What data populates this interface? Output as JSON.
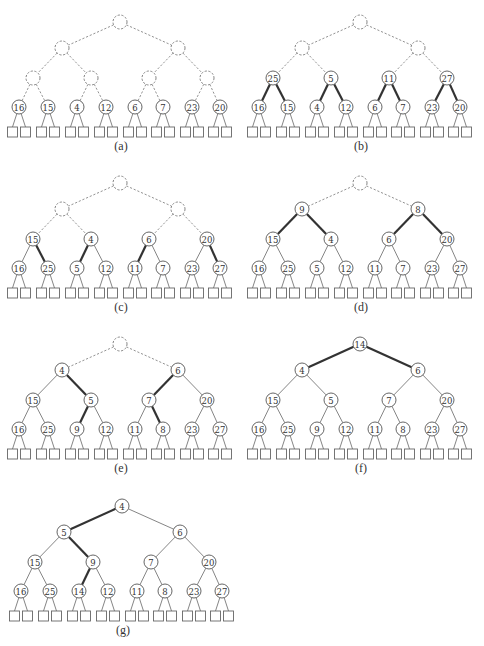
{
  "figure": {
    "layout": {
      "level_y": [
        22,
        48,
        78,
        107
      ],
      "level_x": [
        [
          120
        ],
        [
          62,
          178
        ],
        [
          33,
          91,
          149,
          207
        ],
        [
          19,
          48,
          77,
          106,
          135,
          163,
          192,
          220
        ]
      ],
      "leaf_y": 127,
      "leaf_size": 10,
      "leaf_dx": 6.5,
      "node_r": 7,
      "label_y": 146
    },
    "panels": [
      {
        "id": "a",
        "label": "(a)",
        "dx": 0,
        "dy": 0,
        "levels": [
          [
            ""
          ],
          [
            "",
            ""
          ],
          [
            "",
            "",
            "",
            ""
          ],
          [
            "16",
            "15",
            "4",
            "12",
            "6",
            "7",
            "23",
            "20"
          ]
        ],
        "dashed_levels": [
          0,
          1,
          2
        ],
        "thick_edges": []
      },
      {
        "id": "b",
        "label": "(b)",
        "dx": 240,
        "dy": 0,
        "levels": [
          [
            ""
          ],
          [
            "",
            ""
          ],
          [
            "25",
            "5",
            "11",
            "27"
          ],
          [
            "16",
            "15",
            "4",
            "12",
            "6",
            "7",
            "23",
            "20"
          ]
        ],
        "dashed_levels": [
          0,
          1
        ],
        "thick_edges": [
          [
            2,
            0,
            0
          ],
          [
            2,
            0,
            1
          ],
          [
            2,
            1,
            0
          ],
          [
            2,
            1,
            1
          ],
          [
            2,
            2,
            0
          ],
          [
            2,
            2,
            1
          ],
          [
            2,
            3,
            0
          ],
          [
            2,
            3,
            1
          ]
        ]
      },
      {
        "id": "c",
        "label": "(c)",
        "dx": 0,
        "dy": 161,
        "levels": [
          [
            ""
          ],
          [
            "",
            ""
          ],
          [
            "15",
            "4",
            "6",
            "20"
          ],
          [
            "16",
            "25",
            "5",
            "12",
            "11",
            "7",
            "23",
            "27"
          ]
        ],
        "dashed_levels": [
          0,
          1
        ],
        "thick_edges": [
          [
            2,
            0,
            1
          ],
          [
            2,
            1,
            0
          ],
          [
            2,
            2,
            0
          ],
          [
            2,
            3,
            1
          ]
        ]
      },
      {
        "id": "d",
        "label": "(d)",
        "dx": 240,
        "dy": 161,
        "levels": [
          [
            ""
          ],
          [
            "9",
            "8"
          ],
          [
            "15",
            "4",
            "6",
            "20"
          ],
          [
            "16",
            "25",
            "5",
            "12",
            "11",
            "7",
            "23",
            "27"
          ]
        ],
        "dashed_levels": [
          0
        ],
        "thick_edges": [
          [
            1,
            0,
            0
          ],
          [
            1,
            0,
            1
          ],
          [
            1,
            1,
            0
          ],
          [
            1,
            1,
            1
          ]
        ]
      },
      {
        "id": "e",
        "label": "(e)",
        "dx": 0,
        "dy": 322,
        "levels": [
          [
            ""
          ],
          [
            "4",
            "6"
          ],
          [
            "15",
            "5",
            "7",
            "20"
          ],
          [
            "16",
            "25",
            "9",
            "12",
            "11",
            "8",
            "23",
            "27"
          ]
        ],
        "dashed_levels": [
          0
        ],
        "thick_edges": [
          [
            1,
            0,
            1
          ],
          [
            2,
            1,
            0
          ],
          [
            1,
            1,
            0
          ],
          [
            2,
            2,
            1
          ]
        ]
      },
      {
        "id": "f",
        "label": "(f)",
        "dx": 240,
        "dy": 322,
        "levels": [
          [
            "14"
          ],
          [
            "4",
            "6"
          ],
          [
            "15",
            "5",
            "7",
            "20"
          ],
          [
            "16",
            "25",
            "9",
            "12",
            "11",
            "8",
            "23",
            "27"
          ]
        ],
        "dashed_levels": [],
        "thick_edges": [
          [
            0,
            0,
            0
          ],
          [
            0,
            0,
            1
          ]
        ]
      },
      {
        "id": "g",
        "label": "(g)",
        "dx": 2,
        "dy": 484,
        "levels": [
          [
            "4"
          ],
          [
            "5",
            "6"
          ],
          [
            "15",
            "9",
            "7",
            "20"
          ],
          [
            "16",
            "25",
            "14",
            "12",
            "11",
            "8",
            "23",
            "27"
          ]
        ],
        "dashed_levels": [],
        "thick_edges": [
          [
            0,
            0,
            0
          ],
          [
            1,
            0,
            1
          ],
          [
            2,
            1,
            0
          ]
        ]
      }
    ]
  },
  "colors": {
    "background": "#ffffff",
    "stroke": "#555555",
    "thick_stroke": "#333333",
    "text": "#333333"
  }
}
